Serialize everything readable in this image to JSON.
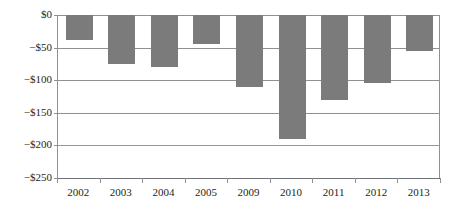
{
  "chart_data": {
    "type": "bar",
    "title": "",
    "subtitle": "",
    "xlabel": "",
    "ylabel": "",
    "categories": [
      "2002",
      "2003",
      "2004",
      "2005",
      "2009",
      "2010",
      "2011",
      "2012",
      "2013"
    ],
    "values": [
      -39,
      -75,
      -80,
      -45,
      -110,
      -190,
      -130,
      -105,
      -55
    ],
    "series": [
      {
        "name": "",
        "values": [
          -39,
          -75,
          -80,
          -45,
          -110,
          -190,
          -130,
          -105,
          -55
        ]
      }
    ],
    "ylim": [
      -250,
      0
    ],
    "ytick_values": [
      0,
      -50,
      -100,
      -150,
      -200,
      -250
    ],
    "ytick_labels": [
      "$0",
      "−$50",
      "−$100",
      "−$150",
      "−$200",
      "−$250"
    ],
    "grid": true,
    "grid_axis": "y",
    "legend": false,
    "legend_position": "none",
    "bar_color": "#7b7b7b",
    "axis_color": "#8e9095",
    "text_color": "#231f20",
    "background": "#ffffff"
  }
}
